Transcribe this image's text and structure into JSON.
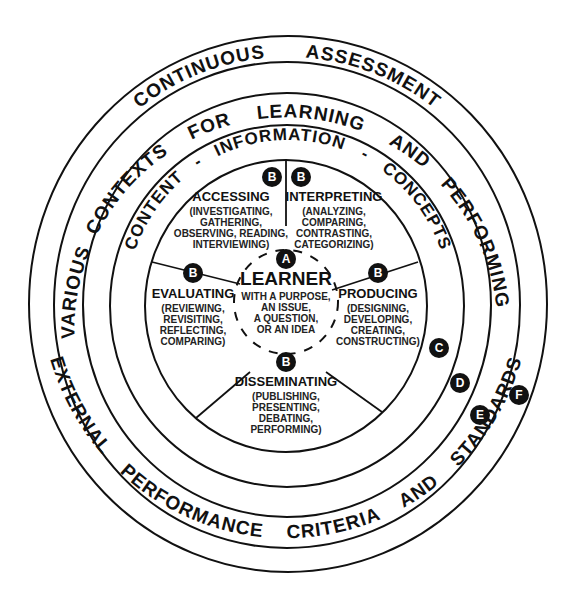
{
  "diagram": {
    "rings": {
      "F": "EXTERNAL PERFORMANCE CRITERIA AND STANDARDS",
      "E": "CONTINUOUS ASSESSMENT",
      "D_top": "FOR LEARNING AND PERFORMING",
      "D_left": "VARIOUS CONTEXTS",
      "C_left": "CONTENT",
      "C_top": "INFORMATION",
      "C_right": "CONCEPTS",
      "C_sep1": "-",
      "C_sep2": "-"
    },
    "ring_words": {
      "E": [
        "CONTINUOUS",
        "ASSESSMENT"
      ],
      "D": [
        "VARIOUS",
        "CONTEXTS",
        "FOR",
        "LEARNING",
        "AND",
        "PERFORMING"
      ],
      "C": [
        "CONTENT",
        "-",
        "INFORMATION",
        "-",
        "CONCEPTS"
      ],
      "F": [
        "EXTERNAL",
        "PERFORMANCE",
        "CRITERIA",
        "AND",
        "STANDARDS"
      ]
    },
    "center": {
      "badge": "A",
      "title": "LEARNER",
      "lines": [
        "WITH A PURPOSE,",
        "AN ISSUE,",
        "A QUESTION,",
        "OR AN IDEA"
      ]
    },
    "segments": [
      {
        "badge": "B",
        "title": "ACCESSING",
        "lines": [
          "(INVESTIGATING,",
          "GATHERING,",
          "OBSERVING, READING,",
          "INTERVIEWING)"
        ]
      },
      {
        "badge": "B",
        "title": "INTERPRETING",
        "lines": [
          "(ANALYZING,",
          "COMPARING,",
          "CONTRASTING,",
          "CATEGORIZING)"
        ]
      },
      {
        "badge": "B",
        "title": "PRODUCING",
        "lines": [
          "(DESIGNING,",
          "DEVELOPING,",
          "CREATING,",
          "CONSTRUCTING)"
        ]
      },
      {
        "badge": "B",
        "title": "DISSEMINATING",
        "lines": [
          "(PUBLISHING,",
          "PRESENTING,",
          "DEBATING,",
          "PERFORMING)"
        ]
      },
      {
        "badge": "B",
        "title": "EVALUATING",
        "lines": [
          "(REVIEWING,",
          "REVISITING,",
          "REFLECTING,",
          "COMPARING)"
        ]
      }
    ],
    "ring_badges": [
      "C",
      "D",
      "E",
      "F"
    ]
  }
}
